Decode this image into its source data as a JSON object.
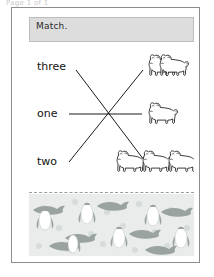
{
  "document": {
    "top_sliver_text": "Page 1 of 1",
    "frame_label": "worksheet-page"
  },
  "instruction": {
    "text": "Match."
  },
  "activity": {
    "type": "matching-worksheet",
    "word_labels": [
      {
        "id": "three",
        "text": "three",
        "count": 3
      },
      {
        "id": "one",
        "text": "one",
        "count": 1
      },
      {
        "id": "two",
        "text": "two",
        "count": 2
      }
    ],
    "picture_groups": [
      {
        "id": "group-top",
        "icon": "dog-icon",
        "count": 2,
        "matches_word": "two"
      },
      {
        "id": "group-middle",
        "icon": "dog-icon",
        "count": 1,
        "matches_word": "one"
      },
      {
        "id": "group-bottom",
        "icon": "dog-icon",
        "count": 3,
        "matches_word": "three"
      }
    ],
    "connector_lines": [
      {
        "from": "three",
        "to": "group-bottom"
      },
      {
        "from": "one",
        "to": "group-middle"
      },
      {
        "from": "two",
        "to": "group-top"
      }
    ]
  },
  "decoration": {
    "tear_line_style": "dashed",
    "strip_pattern": "penguins-and-whales",
    "strip_background": "#e9ecea",
    "penguin_body_color": "#ffffff",
    "whale_color": "#9aa3a0",
    "dot_color": "#d6dcd9"
  },
  "colors": {
    "frame_border": "#8d8d8d",
    "banner_background": "#dddddd",
    "ink": "#111111",
    "page_background": "#ffffff"
  }
}
